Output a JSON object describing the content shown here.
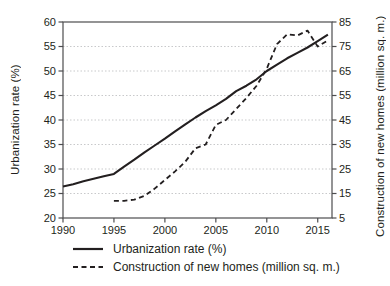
{
  "chart_data": {
    "type": "line",
    "title": "",
    "ylabel_left": "Urbanization rate (%)",
    "ylabel_right": "Construction of new homes (million sq. m.)",
    "x_axis": {
      "min": 1990,
      "max": 2016.4,
      "ticks": [
        1990,
        1995,
        2000,
        2005,
        2010,
        2015
      ]
    },
    "y_axis_left": {
      "min": 20,
      "max": 60,
      "ticks": [
        20,
        25,
        30,
        35,
        40,
        45,
        50,
        55,
        60
      ]
    },
    "y_axis_right": {
      "min": 5,
      "max": 85,
      "ticks": [
        5,
        15,
        25,
        35,
        45,
        55,
        65,
        75,
        85
      ]
    },
    "grid": "horizontal",
    "legend_position": "bottom-left",
    "series": [
      {
        "name": "Urbanization rate (%)",
        "axis": "left",
        "style": "solid",
        "x": [
          1990,
          1991,
          1992,
          1993,
          1994,
          1995,
          1996,
          1997,
          1998,
          1999,
          2000,
          2001,
          2002,
          2003,
          2004,
          2005,
          2006,
          2007,
          2008,
          2009,
          2010,
          2011,
          2012,
          2013,
          2014,
          2015,
          2016
        ],
        "y": [
          26.4,
          26.9,
          27.5,
          28.0,
          28.5,
          29.0,
          30.5,
          31.9,
          33.4,
          34.8,
          36.2,
          37.7,
          39.1,
          40.5,
          41.8,
          43.0,
          44.3,
          45.9,
          47.0,
          48.3,
          50.0,
          51.3,
          52.6,
          53.7,
          54.8,
          56.1,
          57.4
        ]
      },
      {
        "name": "Construction of new homes (million sq. m.)",
        "axis": "right",
        "style": "dashed",
        "x": [
          1995,
          1996,
          1997,
          1998,
          1999,
          2000,
          2001,
          2002,
          2003,
          2004,
          2005,
          2006,
          2007,
          2008,
          2009,
          2010,
          2011,
          2012,
          2013,
          2014,
          2015,
          2016
        ],
        "y": [
          12,
          12,
          12.5,
          14,
          17,
          20.5,
          24,
          28,
          33.5,
          35,
          43,
          45,
          49.5,
          54,
          59,
          66,
          76,
          80,
          79.5,
          81.5,
          75,
          77.5
        ]
      }
    ],
    "colors": {
      "line": "#231f20",
      "axis": "#4d4d4f",
      "grid": "#c8c9cb",
      "text": "#231f20",
      "background": "#ffffff"
    }
  }
}
